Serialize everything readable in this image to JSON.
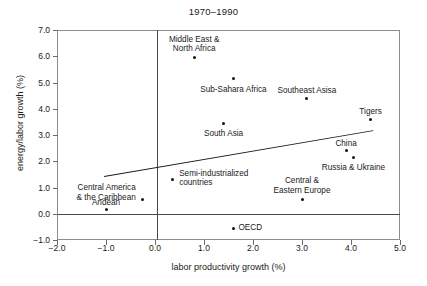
{
  "chart_data": {
    "type": "scatter",
    "title": "1970–1990",
    "xlabel": "labor productivity growth (%)",
    "ylabel": "energy/labor growth (%)",
    "xlim": [
      -2.0,
      5.0
    ],
    "ylim": [
      -1.0,
      7.0
    ],
    "xticks": [
      "-2.0",
      "-1.0",
      "0.0",
      "1.0",
      "2.0",
      "3.0",
      "4.0",
      "5.0"
    ],
    "xtick_values": [
      -2.0,
      -1.0,
      0.0,
      1.0,
      2.0,
      3.0,
      4.0,
      5.0
    ],
    "yticks": [
      "-1.0",
      "0.0",
      "1.0",
      "2.0",
      "3.0",
      "4.0",
      "5.0",
      "6.0",
      "7.0"
    ],
    "ytick_values": [
      -1.0,
      0.0,
      1.0,
      2.0,
      3.0,
      4.0,
      5.0,
      6.0,
      7.0
    ],
    "grid": false,
    "legend": "none",
    "points": [
      {
        "label": "Middle East &\nNorth Africa",
        "x": 0.8,
        "y": 5.95,
        "label_pos": "above",
        "align": "c",
        "dx": 0,
        "dy": -23
      },
      {
        "label": "Sub-Sahara Africa",
        "x": 1.6,
        "y": 5.15,
        "label_pos": "below",
        "align": "c",
        "dx": 0,
        "dy": 6
      },
      {
        "label": "Southeast Asisa",
        "x": 3.1,
        "y": 4.4,
        "label_pos": "above",
        "align": "c",
        "dx": 0,
        "dy": -12
      },
      {
        "label": "Tigers",
        "x": 4.4,
        "y": 3.6,
        "label_pos": "above",
        "align": "c",
        "dx": 0,
        "dy": -12
      },
      {
        "label": "South Asia",
        "x": 1.4,
        "y": 3.45,
        "label_pos": "below",
        "align": "c",
        "dx": 0,
        "dy": 6
      },
      {
        "label": "China",
        "x": 3.9,
        "y": 2.4,
        "label_pos": "above",
        "align": "c",
        "dx": 0,
        "dy": -12
      },
      {
        "label": "Russia & Ukraine",
        "x": 4.05,
        "y": 2.15,
        "label_pos": "below",
        "align": "c",
        "dx": 0,
        "dy": 6
      },
      {
        "label": "Semi-industrialized\ncountries",
        "x": 0.35,
        "y": 1.3,
        "label_pos": "right",
        "align": "l",
        "dx": 7,
        "dy": -11
      },
      {
        "label": "Central America\n& the Caribbean",
        "x": -0.25,
        "y": 0.55,
        "label_pos": "left",
        "align": "r",
        "dx": -7,
        "dy": -16
      },
      {
        "label": "Andean",
        "x": -1.0,
        "y": 0.15,
        "label_pos": "above",
        "align": "c",
        "dx": 0,
        "dy": -12
      },
      {
        "label": "Central &\nEastern Europe",
        "x": 3.0,
        "y": 0.55,
        "label_pos": "above",
        "align": "c",
        "dx": 0,
        "dy": -23
      },
      {
        "label": "OECD",
        "x": 1.6,
        "y": -0.55,
        "label_pos": "right",
        "align": "l",
        "dx": 5,
        "dy": -5
      }
    ],
    "trendline": {
      "x0": -1.05,
      "y0": 1.45,
      "x1": 4.45,
      "y1": 3.2,
      "color": "#1a1a1a"
    }
  }
}
